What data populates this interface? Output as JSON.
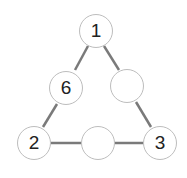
{
  "puzzle": {
    "type": "number-triangle",
    "nodes": [
      {
        "id": "top",
        "value": "1",
        "x": 96,
        "y": 31
      },
      {
        "id": "left-mid",
        "value": "6",
        "x": 66,
        "y": 88
      },
      {
        "id": "right-mid",
        "value": "",
        "x": 127,
        "y": 86
      },
      {
        "id": "bottom-left",
        "value": "2",
        "x": 34,
        "y": 143
      },
      {
        "id": "bottom-mid",
        "value": "",
        "x": 98,
        "y": 143
      },
      {
        "id": "bottom-right",
        "value": "3",
        "x": 160,
        "y": 143
      }
    ],
    "edge_color": "#7a7a7a",
    "circle_border": "#bdbdbd"
  }
}
